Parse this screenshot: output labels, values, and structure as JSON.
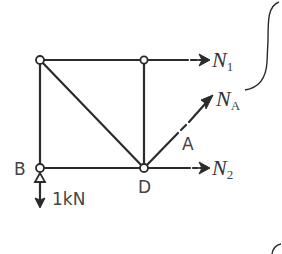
{
  "diagram": {
    "type": "truss-free-body",
    "nodes": [
      {
        "id": "top-left",
        "x": 40,
        "y": 60,
        "label": ""
      },
      {
        "id": "top-mid",
        "x": 144,
        "y": 60,
        "label": ""
      },
      {
        "id": "B",
        "x": 40,
        "y": 168,
        "label": "B"
      },
      {
        "id": "D",
        "x": 144,
        "y": 168,
        "label": "D"
      }
    ],
    "members": [
      {
        "from": "top-left",
        "to": "top-mid"
      },
      {
        "from": "top-left",
        "to": "B"
      },
      {
        "from": "top-left",
        "to": "D"
      },
      {
        "from": "top-mid",
        "to": "D"
      },
      {
        "from": "B",
        "to": "D"
      }
    ],
    "labels": {
      "node_b": "B",
      "node_d": "D",
      "member_a": "A",
      "load": "1kN"
    },
    "forces": {
      "n1": {
        "symbol": "N",
        "subscript": "1"
      },
      "na": {
        "symbol": "N",
        "subscript": "A"
      },
      "n2": {
        "symbol": "N",
        "subscript": "2"
      }
    },
    "colors": {
      "line": "#2b2b2b",
      "text": "#444444",
      "background": "#ffffff"
    }
  }
}
